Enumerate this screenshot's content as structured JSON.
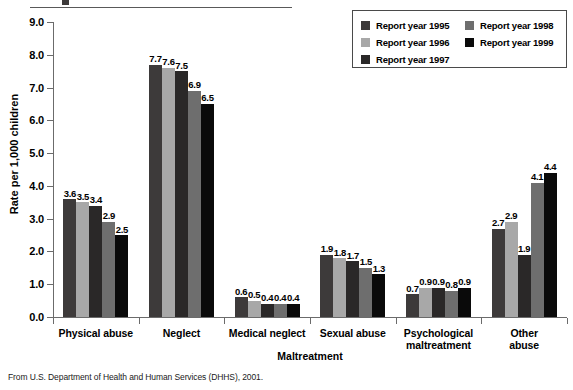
{
  "footnote": "From U.S. Department of Health and Human Services (DHHS), 2001.",
  "legend": {
    "items": [
      {
        "label": "Report year 1995",
        "color": "#3d3a3a"
      },
      {
        "label": "Report year 1996",
        "color": "#a8a8a8"
      },
      {
        "label": "Report year 1997",
        "color": "#2a2828"
      },
      {
        "label": "Report year 1998",
        "color": "#6e6e6e"
      },
      {
        "label": "Report year 1999",
        "color": "#0a0a0a"
      }
    ]
  },
  "chart_data": {
    "type": "bar",
    "title": "",
    "xlabel": "Maltreatment",
    "ylabel": "Rate per 1,000 children",
    "ylim": [
      0.0,
      9.0
    ],
    "ytick_step": 1.0,
    "ytick_labels": [
      "0.0",
      "1.0",
      "2.0",
      "3.0",
      "4.0",
      "5.0",
      "6.0",
      "7.0",
      "8.0",
      "9.0"
    ],
    "grid": false,
    "legend_position": "top-right",
    "categories": [
      "Physical abuse",
      "Neglect",
      "Medical neglect",
      "Sexual abuse",
      "Psychological maltreatment",
      "Other abuse"
    ],
    "category_lines": [
      [
        "Physical abuse"
      ],
      [
        "Neglect"
      ],
      [
        "Medical neglect"
      ],
      [
        "Sexual abuse"
      ],
      [
        "Psychological",
        "maltreatment"
      ],
      [
        "Other",
        "abuse"
      ]
    ],
    "series": [
      {
        "name": "Report year 1995",
        "color": "#3d3a3a",
        "values": [
          3.6,
          7.7,
          0.6,
          1.9,
          0.7,
          2.7
        ]
      },
      {
        "name": "Report year 1996",
        "color": "#a8a8a8",
        "values": [
          3.5,
          7.6,
          0.5,
          1.8,
          0.9,
          2.9
        ]
      },
      {
        "name": "Report year 1997",
        "color": "#2a2828",
        "values": [
          3.4,
          7.5,
          0.4,
          1.7,
          0.9,
          1.9
        ]
      },
      {
        "name": "Report year 1998",
        "color": "#6e6e6e",
        "values": [
          2.9,
          6.9,
          0.4,
          1.5,
          0.8,
          4.1
        ]
      },
      {
        "name": "Report year 1999",
        "color": "#0a0a0a",
        "values": [
          2.5,
          6.5,
          0.4,
          1.3,
          0.9,
          4.4
        ]
      }
    ]
  }
}
